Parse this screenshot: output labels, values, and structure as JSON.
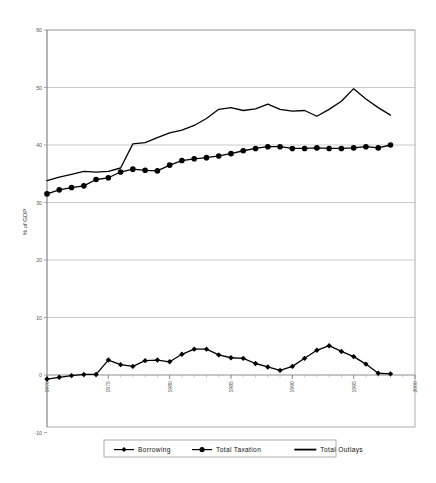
{
  "chart_data": {
    "type": "line",
    "title": "",
    "subtitle": "",
    "xlabel": "",
    "ylabel": "% of GDP",
    "xlim": [
      1970,
      2000
    ],
    "ylim": [
      -10,
      60
    ],
    "ytick_values": [
      60,
      50,
      40,
      30,
      20,
      10,
      0,
      -10
    ],
    "ytick_labels": [
      "60",
      "50",
      "40",
      "30",
      "20",
      "10",
      "0",
      "-10"
    ],
    "xtick_values": [
      1970,
      1975,
      1980,
      1985,
      1990,
      1995,
      2000
    ],
    "xtick_labels": [
      "1970",
      "1975",
      "1980",
      "1985",
      "1990",
      "1995",
      "2000"
    ],
    "grid": "horizontal",
    "legend_position": "bottom",
    "x": [
      1970,
      1971,
      1972,
      1973,
      1974,
      1975,
      1976,
      1977,
      1978,
      1979,
      1980,
      1981,
      1982,
      1983,
      1984,
      1985,
      1986,
      1987,
      1988,
      1989,
      1990,
      1991,
      1992,
      1993,
      1994,
      1995,
      1996,
      1997,
      1998
    ],
    "series": [
      {
        "name": "Borrowing",
        "marker": "diamond",
        "color": "#000000",
        "values": [
          -0.7,
          -0.4,
          -0.1,
          0.1,
          0.1,
          2.6,
          1.8,
          1.5,
          2.5,
          2.6,
          2.3,
          3.6,
          4.5,
          4.5,
          3.5,
          3.0,
          2.9,
          2.0,
          1.4,
          0.8,
          1.5,
          2.9,
          4.3,
          5.1,
          4.1,
          3.2,
          1.9,
          0.3,
          0.2
        ]
      },
      {
        "name": "Total Taxation",
        "marker": "circle",
        "color": "#000000",
        "values": [
          31.5,
          32.2,
          32.6,
          32.9,
          34.0,
          34.3,
          35.3,
          35.8,
          35.6,
          35.5,
          36.5,
          37.3,
          37.6,
          37.8,
          38.1,
          38.5,
          39.0,
          39.4,
          39.7,
          39.7,
          39.4,
          39.4,
          39.5,
          39.4,
          39.4,
          39.5,
          39.7,
          39.5,
          40.0
        ]
      },
      {
        "name": "Total Outlays",
        "marker": "none",
        "color": "#000000",
        "values": [
          33.8,
          34.4,
          34.9,
          35.4,
          35.3,
          35.4,
          36.0,
          40.2,
          40.4,
          41.3,
          42.1,
          42.6,
          43.4,
          44.6,
          46.2,
          46.5,
          46.0,
          46.3,
          47.1,
          46.2,
          45.9,
          46.0,
          45.0,
          46.2,
          47.6,
          49.8,
          48.0,
          46.5,
          45.2
        ]
      }
    ]
  },
  "legend": {
    "items": [
      {
        "label": "Borrowing",
        "marker": "diamond"
      },
      {
        "label": "Total Taxation",
        "marker": "circle"
      },
      {
        "label": "Total Outlays",
        "marker": "none"
      }
    ]
  },
  "colors": {
    "series": "#000000",
    "grid": "#aaaaaa",
    "axis": "#888888",
    "frame": "#999999",
    "background": "#ffffff"
  }
}
